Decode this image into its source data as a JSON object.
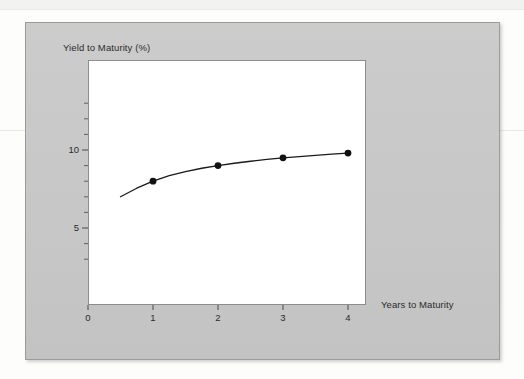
{
  "figure": {
    "panel_color": "#c9c9c9",
    "plot_background": "#ffffff",
    "curve_color": "#1a1a1a",
    "marker_color": "#111111",
    "axis_color": "#2b2b2b"
  },
  "chart_data": {
    "type": "line",
    "title": "",
    "subtitle": "",
    "xlabel": "Years to Maturity",
    "ylabel": "Yield to Maturity (%)",
    "xlim": [
      0,
      4.3
    ],
    "ylim": [
      0,
      13.7
    ],
    "grid": false,
    "legend": null,
    "x_ticks": [
      0,
      1,
      2,
      3,
      4
    ],
    "x_tick_labels": [
      "0",
      "1",
      "2",
      "3",
      "4"
    ],
    "y_ticks": [
      5,
      10
    ],
    "y_tick_labels": [
      "5",
      "10"
    ],
    "y_minor_tick_step": 1,
    "markers": {
      "style": "filled-circle",
      "x": [
        1,
        2,
        3,
        4
      ],
      "y": [
        8.0,
        9.0,
        9.5,
        9.8
      ]
    },
    "series": [
      {
        "name": "Yield curve",
        "x": [
          0.5,
          0.75,
          1.0,
          1.25,
          1.5,
          1.75,
          2.0,
          2.25,
          2.5,
          2.75,
          3.0,
          3.25,
          3.5,
          3.75,
          4.0
        ],
        "y": [
          7.0,
          7.55,
          8.0,
          8.35,
          8.62,
          8.83,
          9.0,
          9.15,
          9.28,
          9.4,
          9.5,
          9.58,
          9.66,
          9.73,
          9.8
        ]
      }
    ],
    "annotations": []
  },
  "axis_titles": {
    "y": "Yield to Maturity (%)",
    "x": "Years to Maturity"
  }
}
